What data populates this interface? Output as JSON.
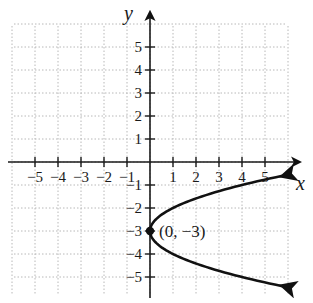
{
  "chart_data": {
    "type": "line",
    "title": "",
    "xlabel": "x",
    "ylabel": "y",
    "xlim": [
      -6,
      6
    ],
    "ylim": [
      -6,
      6
    ],
    "grid": true,
    "grid_style": "dotted",
    "x_ticks": [
      -5,
      -4,
      -3,
      -2,
      -1,
      1,
      2,
      3,
      4,
      5
    ],
    "y_ticks": [
      -5,
      -4,
      -3,
      -2,
      -1,
      1,
      2,
      3,
      4,
      5
    ],
    "x_tick_labels": [
      "-5",
      "-4",
      "-3",
      "-2",
      "-1",
      "1",
      "2",
      "3",
      "4",
      "5"
    ],
    "y_tick_labels": [
      "-5",
      "-4",
      "-3",
      "-2",
      "-1",
      "1",
      "2",
      "3",
      "4",
      "5"
    ],
    "series": [
      {
        "name": "parabola x = (y + 3)^2",
        "equation": "x = (y + 3)^2",
        "opens": "right",
        "arrows_on_ends": true,
        "points": [
          {
            "x": 6,
            "y": -0.55
          },
          {
            "x": 4,
            "y": -1
          },
          {
            "x": 1,
            "y": -2
          },
          {
            "x": 0,
            "y": -3
          },
          {
            "x": 1,
            "y": -4
          },
          {
            "x": 4,
            "y": -5
          },
          {
            "x": 6,
            "y": -5.45
          }
        ]
      }
    ],
    "annotations": [
      {
        "type": "point",
        "x": 0,
        "y": -3,
        "label": "(0, −3)"
      }
    ]
  },
  "labels": {
    "x_axis": "x",
    "y_axis": "y",
    "vertex": "(0, −3)",
    "x_ticks": [
      "−5",
      "−4",
      "−3",
      "−2",
      "−1",
      "1",
      "2",
      "3",
      "4",
      "5"
    ],
    "y_pos_ticks": [
      "5",
      "4",
      "3",
      "2",
      "1"
    ],
    "y_neg_ticks": [
      "−1",
      "−2",
      "−3",
      "−4",
      "−5"
    ]
  },
  "colors": {
    "axis": "#1a1a1a",
    "curve": "#111111",
    "grid": "#b8b8b8",
    "background": "#ffffff"
  }
}
